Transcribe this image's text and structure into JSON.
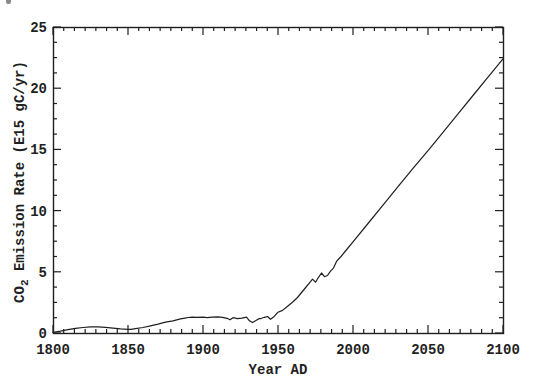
{
  "figure": {
    "background": "#ffffff",
    "ink_color": "#1f1f1f",
    "scan_artifact": "small dark speck at top-left edge"
  },
  "chart_data": {
    "type": "line",
    "title": "",
    "xlabel": "Year AD",
    "ylabel": {
      "pre": "CO",
      "sub": "2",
      "post": " Emission Rate (E15 gC/yr)"
    },
    "ylabel_text": "CO2 Emission Rate (E15 gC/yr)",
    "xlim": [
      1800,
      2100
    ],
    "ylim": [
      0,
      25
    ],
    "x_major_ticks": [
      1800,
      1850,
      1900,
      1950,
      2000,
      2050,
      2100
    ],
    "y_major_ticks": [
      0,
      5,
      10,
      15,
      20,
      25
    ],
    "x_minor_per_interval": 6,
    "y_minor_per_interval": 3,
    "grid": false,
    "legend": "none",
    "frame": "closed box, ticks inward on all four sides",
    "series": [
      {
        "name": "CO2 emission rate (historical and projected)",
        "points": [
          [
            1800,
            0.05
          ],
          [
            1805,
            0.15
          ],
          [
            1810,
            0.27
          ],
          [
            1815,
            0.38
          ],
          [
            1820,
            0.45
          ],
          [
            1825,
            0.5
          ],
          [
            1830,
            0.5
          ],
          [
            1835,
            0.46
          ],
          [
            1840,
            0.4
          ],
          [
            1845,
            0.34
          ],
          [
            1850,
            0.3
          ],
          [
            1852,
            0.3
          ],
          [
            1855,
            0.36
          ],
          [
            1860,
            0.45
          ],
          [
            1865,
            0.58
          ],
          [
            1870,
            0.72
          ],
          [
            1875,
            0.88
          ],
          [
            1880,
            1.0
          ],
          [
            1885,
            1.15
          ],
          [
            1888,
            1.22
          ],
          [
            1890,
            1.27
          ],
          [
            1893,
            1.3
          ],
          [
            1896,
            1.28
          ],
          [
            1900,
            1.3
          ],
          [
            1903,
            1.25
          ],
          [
            1906,
            1.3
          ],
          [
            1910,
            1.32
          ],
          [
            1913,
            1.28
          ],
          [
            1916,
            1.2
          ],
          [
            1918,
            1.08
          ],
          [
            1920,
            1.25
          ],
          [
            1923,
            1.18
          ],
          [
            1926,
            1.22
          ],
          [
            1929,
            1.3
          ],
          [
            1931,
            1.0
          ],
          [
            1933,
            0.85
          ],
          [
            1935,
            1.0
          ],
          [
            1937,
            1.15
          ],
          [
            1939,
            1.2
          ],
          [
            1941,
            1.28
          ],
          [
            1943,
            1.35
          ],
          [
            1945,
            1.12
          ],
          [
            1947,
            1.3
          ],
          [
            1950,
            1.7
          ],
          [
            1953,
            1.85
          ],
          [
            1956,
            2.15
          ],
          [
            1960,
            2.55
          ],
          [
            1963,
            2.9
          ],
          [
            1966,
            3.35
          ],
          [
            1969,
            3.8
          ],
          [
            1971,
            4.1
          ],
          [
            1973,
            4.4
          ],
          [
            1975,
            4.15
          ],
          [
            1977,
            4.55
          ],
          [
            1979,
            4.9
          ],
          [
            1981,
            4.6
          ],
          [
            1983,
            4.7
          ],
          [
            1985,
            5.05
          ],
          [
            1987,
            5.3
          ],
          [
            1989,
            5.85
          ],
          [
            1992,
            6.25
          ],
          [
            1995,
            6.7
          ],
          [
            2000,
            7.45
          ],
          [
            2010,
            8.95
          ],
          [
            2020,
            10.45
          ],
          [
            2030,
            11.95
          ],
          [
            2040,
            13.45
          ],
          [
            2050,
            14.9
          ],
          [
            2060,
            16.4
          ],
          [
            2070,
            17.9
          ],
          [
            2080,
            19.4
          ],
          [
            2090,
            20.9
          ],
          [
            2100,
            22.4
          ]
        ]
      }
    ],
    "layout": {
      "plot_left": 53,
      "plot_top": 27,
      "plot_right": 503,
      "plot_bottom": 333,
      "major_tick_len": 8,
      "minor_tick_len": 4
    }
  }
}
